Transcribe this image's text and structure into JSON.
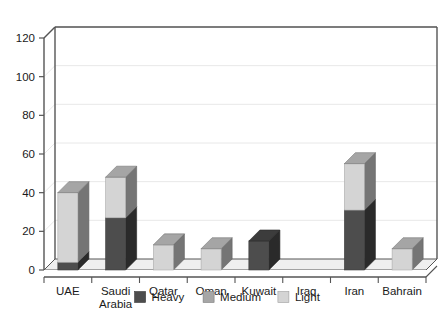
{
  "chart_data": {
    "type": "bar",
    "subtype": "stacked-3d-column",
    "title": "",
    "subtitle": "",
    "xlabel": "",
    "ylabel": "",
    "categories": [
      "UAE",
      "Saudi Arabia",
      "Qatar",
      "Oman",
      "Kuwait",
      "Iraq",
      "Iran",
      "Bahrain"
    ],
    "category_lines": [
      [
        "UAE"
      ],
      [
        "Saudi",
        "Arabia"
      ],
      [
        "Qatar"
      ],
      [
        "Oman"
      ],
      [
        "Kuwait"
      ],
      [
        "Iraq"
      ],
      [
        "Iran"
      ],
      [
        "Bahrain"
      ]
    ],
    "series": [
      {
        "name": "Heavy",
        "color": "#4d4d4d",
        "values": [
          4,
          27,
          0,
          0,
          15,
          0,
          31,
          0
        ]
      },
      {
        "name": "Medium",
        "color": "#a6a6a6",
        "values": [
          0,
          0,
          0,
          0,
          0,
          0,
          0,
          0
        ]
      },
      {
        "name": "Light",
        "color": "#d4d4d4",
        "values": [
          36,
          21,
          13,
          11,
          0,
          0,
          24,
          11
        ]
      }
    ],
    "totals": [
      40,
      48,
      13,
      11,
      15,
      0,
      55,
      11
    ],
    "ylim": [
      0,
      120
    ],
    "yticks": [
      0,
      20,
      40,
      60,
      80,
      100,
      120
    ],
    "ytick_labels": [
      "0",
      "20",
      "40",
      "60",
      "80",
      "100",
      "120"
    ],
    "grid": true,
    "grid_axis": "y",
    "legend": {
      "position": "bottom",
      "entries": [
        {
          "label": "Heavy",
          "color": "#4d4d4d"
        },
        {
          "label": "Medium",
          "color": "#a6a6a6"
        },
        {
          "label": "Light",
          "color": "#d4d4d4"
        }
      ]
    },
    "colors": {
      "axis": "#555555",
      "grid": "#e8e8e8",
      "floor": "#efefef",
      "plot_background": "#ffffff",
      "text": "#1a1a1a"
    }
  }
}
